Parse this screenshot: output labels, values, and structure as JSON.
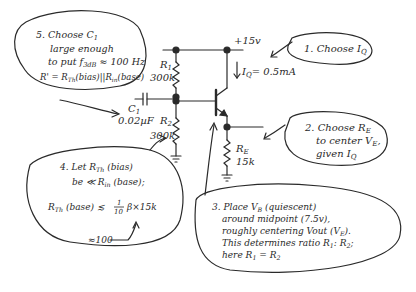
{
  "circuit": {
    "supply": "+15v",
    "iq": "I",
    "iq_sub": "Q",
    "iq_value": "= 0.5mA",
    "r1": {
      "label": "R",
      "sub": "1",
      "value": "300k"
    },
    "r2": {
      "label": "R",
      "sub": "2",
      "value": "300k"
    },
    "re": {
      "label": "R",
      "sub": "E",
      "value": "15k"
    },
    "c1": {
      "label": "C",
      "sub": "1",
      "value": "0.02µF"
    }
  },
  "notes": [
    {
      "step": "1.",
      "lines": [
        "Choose I_Q"
      ]
    },
    {
      "step": "2.",
      "lines": [
        "Choose R_E",
        "to center V_E,",
        "given I_Q"
      ]
    },
    {
      "step": "3.",
      "lines": [
        "Place V_B (quiescent)",
        "around midpoint (7.5v),",
        "roughly centering Vout (V_E).",
        "This determines ratio R1 : R2;",
        "here R1 = R2"
      ]
    },
    {
      "step": "4.",
      "lines": [
        "Let R_Th (bias)",
        "be << R_in (base);",
        "R_Th (base) ≲ 1/10 β×15k",
        "≈100"
      ]
    },
    {
      "step": "5.",
      "lines": [
        "Choose C1",
        "large enough",
        "to put f3dB ≈ 100 Hz",
        "R' = R_Th (bias) || R_in (base)"
      ]
    }
  ],
  "text": {
    "n1_a": "1. Choose I",
    "n1_b": "Q",
    "n2_l1": "2. Choose R",
    "n2_l1s": "E",
    "n2_l2": "to center V",
    "n2_l2s": "E",
    "n2_l2e": ",",
    "n2_l3": "given I",
    "n2_l3s": "Q",
    "n3_l1": "3. Place V",
    "n3_l1s": "B",
    "n3_l1e": " (quiescent)",
    "n3_l2": "around midpoint (7.5v),",
    "n3_l3": "roughly centering Vout (V",
    "n3_l3s": "E",
    "n3_l3e": ").",
    "n3_l4": "This determines ratio R",
    "n3_l4s1": "1",
    "n3_l4m": ": R",
    "n3_l4s2": "2",
    "n3_l4e": ";",
    "n3_l5": "here R",
    "n3_l5s1": "1",
    "n3_l5m": " = R",
    "n3_l5s2": "2",
    "n4_l1": "4. Let R",
    "n4_l1s": "Th",
    "n4_l1e": " (bias)",
    "n4_l2": "be ≪ R",
    "n4_l2s": "in",
    "n4_l2e": " (base);",
    "n4_l3": "R",
    "n4_l3s": "Th",
    "n4_l3e": " (base) ≲",
    "n4_frac_num": "1",
    "n4_frac_den": "10",
    "n4_l3f": "β×15k",
    "n4_l4": "≈100",
    "n5_l1": "5. Choose C",
    "n5_l1s": "1",
    "n5_l2": "large enough",
    "n5_l3": "to put f",
    "n5_l3s": "3dB",
    "n5_l3e": " ≈ 100 Hz",
    "n5_l4": "R' = R",
    "n5_l4s": "Th",
    "n5_l4m": "(bias)||R",
    "n5_l4s2": "in",
    "n5_l4e": "(base)"
  }
}
